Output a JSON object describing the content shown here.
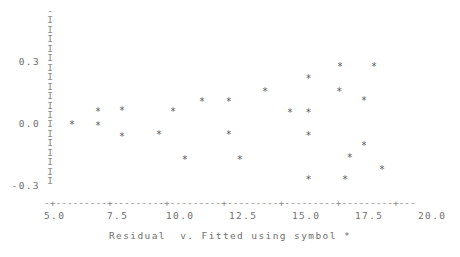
{
  "chart_data": {
    "type": "scatter",
    "title": "",
    "caption": "Residual  v. Fitted using symbol *",
    "xlabel": "Fitted",
    "ylabel": "Residual",
    "symbol": "*",
    "xlim": [
      4.6,
      21.5
    ],
    "ylim": [
      -0.34,
      0.42
    ],
    "grid": false,
    "legend": "none",
    "axis_style": "ascii-character-plot",
    "y_axis_glyph": "I",
    "y_axis_top_glyph": "-",
    "y_axis_glyph_count": 18,
    "x_axis_glyph": "-",
    "x_axis_tick_glyph": "+",
    "xticks": [
      5.0,
      7.5,
      10.0,
      12.5,
      15.0,
      17.5,
      20.0
    ],
    "xtick_labels": [
      "5.0",
      "7.5",
      "10.0",
      "12.5",
      "15.0",
      "17.5",
      "20.0"
    ],
    "yticks": [
      0.3,
      0.0,
      -0.3
    ],
    "ytick_labels": [
      "0.3",
      "0.0",
      "-0.3"
    ],
    "points": [
      {
        "x": 5.6,
        "y": -0.005
      },
      {
        "x": 6.63,
        "y": 0.058
      },
      {
        "x": 6.63,
        "y": -0.01
      },
      {
        "x": 7.58,
        "y": 0.063
      },
      {
        "x": 7.58,
        "y": -0.063
      },
      {
        "x": 9.05,
        "y": -0.053
      },
      {
        "x": 9.6,
        "y": 0.058
      },
      {
        "x": 10.07,
        "y": -0.174
      },
      {
        "x": 10.75,
        "y": 0.106
      },
      {
        "x": 11.82,
        "y": 0.106
      },
      {
        "x": 11.82,
        "y": -0.053
      },
      {
        "x": 12.25,
        "y": -0.174
      },
      {
        "x": 13.25,
        "y": 0.155
      },
      {
        "x": 14.25,
        "y": 0.053
      },
      {
        "x": 14.98,
        "y": 0.218
      },
      {
        "x": 14.98,
        "y": 0.053
      },
      {
        "x": 14.98,
        "y": -0.058
      },
      {
        "x": 14.98,
        "y": -0.271
      },
      {
        "x": 16.2,
        "y": 0.155
      },
      {
        "x": 16.43,
        "y": -0.271
      },
      {
        "x": 16.62,
        "y": -0.165
      },
      {
        "x": 16.23,
        "y": 0.276
      },
      {
        "x": 17.58,
        "y": 0.276
      },
      {
        "x": 17.18,
        "y": 0.111
      },
      {
        "x": 17.18,
        "y": -0.106
      },
      {
        "x": 17.9,
        "y": -0.223
      }
    ]
  },
  "yaxis": {
    "glyph_rows": [
      "-",
      "I",
      "I",
      "I",
      "I",
      "I",
      "I",
      "I",
      "I",
      "I",
      "I",
      "I",
      "I",
      "I",
      "I",
      "I",
      "I",
      "I",
      "I"
    ],
    "labels": [
      {
        "text": "0.3",
        "top": 57
      },
      {
        "text": "0.0",
        "top": 119
      },
      {
        "text": "-0.3",
        "top": 181
      }
    ]
  },
  "xaxis": {
    "line": "-+---------+---------+---------+---------+---------+---------+---",
    "labels": [
      {
        "text": "5.0",
        "left": 44
      },
      {
        "text": "7.5",
        "left": 107
      },
      {
        "text": "10.0",
        "left": 166
      },
      {
        "text": "12.5",
        "left": 229
      },
      {
        "text": "15.0",
        "left": 292
      },
      {
        "text": "17.5",
        "left": 355
      },
      {
        "text": "20.0",
        "left": 418
      }
    ]
  },
  "colors": {
    "background": "#ffffff",
    "axis": "#8a8a8a",
    "text": "#6f6f6f",
    "marker": "#5a5a5a"
  }
}
